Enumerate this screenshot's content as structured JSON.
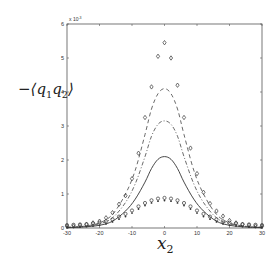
{
  "chart_data": {
    "type": "line",
    "title": "",
    "xlabel": "x_2",
    "ylabel": "-<q1 q2>",
    "ylabel_display": {
      "prefix": "−⟨",
      "q1": "q",
      "sub1": "1",
      "q2": "q",
      "sub2": "2",
      "suffix": "⟩"
    },
    "xlabel_display": {
      "var": "x",
      "sub": "2"
    },
    "y_multiplier": "x 10^-3",
    "y_multiplier_display": "x 10",
    "y_multiplier_exp": "-3",
    "xlim": [
      -30,
      30
    ],
    "ylim": [
      0,
      6
    ],
    "xticks": [
      -30,
      -20,
      -10,
      0,
      10,
      20,
      30
    ],
    "yticks": [
      0,
      1,
      2,
      3,
      4,
      5,
      6
    ],
    "grid": false,
    "legend": null,
    "series": [
      {
        "name": "dashed",
        "style": "dashed",
        "x": [
          -30,
          -25,
          -20,
          -16,
          -12,
          -9,
          -6,
          -4,
          -2,
          0,
          2,
          4,
          6,
          9,
          12,
          16,
          20,
          25,
          30
        ],
        "y": [
          0.02,
          0.05,
          0.15,
          0.4,
          1.0,
          1.7,
          2.75,
          3.5,
          3.95,
          4.1,
          3.95,
          3.5,
          2.75,
          1.7,
          1.0,
          0.4,
          0.15,
          0.05,
          0.02
        ]
      },
      {
        "name": "dash-dot",
        "style": "dashdot",
        "x": [
          -30,
          -25,
          -20,
          -16,
          -12,
          -9,
          -6,
          -4,
          -2,
          0,
          2,
          4,
          6,
          9,
          12,
          16,
          20,
          25,
          30
        ],
        "y": [
          0.02,
          0.04,
          0.12,
          0.3,
          0.75,
          1.3,
          2.1,
          2.7,
          3.05,
          3.15,
          3.05,
          2.7,
          2.1,
          1.3,
          0.75,
          0.3,
          0.12,
          0.04,
          0.02
        ]
      },
      {
        "name": "solid",
        "style": "solid",
        "x": [
          -30,
          -25,
          -20,
          -16,
          -12,
          -9,
          -6,
          -4,
          -2,
          0,
          2,
          4,
          6,
          9,
          12,
          16,
          20,
          25,
          30
        ],
        "y": [
          0.01,
          0.03,
          0.08,
          0.2,
          0.5,
          0.85,
          1.35,
          1.75,
          2.02,
          2.1,
          2.02,
          1.75,
          1.35,
          0.85,
          0.5,
          0.2,
          0.08,
          0.03,
          0.01
        ]
      },
      {
        "name": "diamonds",
        "style": "marker-diamond",
        "x": [
          -30,
          -28,
          -26,
          -24,
          -22,
          -20,
          -18,
          -16,
          -14,
          -12,
          -10,
          -8,
          -6,
          -4,
          -2,
          0,
          2,
          4,
          6,
          8,
          10,
          12,
          14,
          16,
          18,
          20,
          22,
          24,
          26,
          28,
          30
        ],
        "y": [
          0.05,
          0.06,
          0.08,
          0.1,
          0.15,
          0.2,
          0.3,
          0.45,
          0.7,
          0.95,
          1.45,
          2.2,
          3.25,
          4.15,
          5.05,
          5.45,
          5.0,
          4.2,
          3.25,
          2.35,
          1.6,
          1.05,
          0.72,
          0.5,
          0.35,
          0.22,
          0.15,
          0.1,
          0.08,
          0.06,
          0.05
        ]
      },
      {
        "name": "circles",
        "style": "marker-circle",
        "x": [
          -30,
          -28,
          -26,
          -24,
          -22,
          -20,
          -18,
          -16,
          -14,
          -12,
          -10,
          -8,
          -6,
          -4,
          -2,
          0,
          2,
          4,
          6,
          8,
          10,
          12,
          14,
          16,
          18,
          20,
          22,
          24,
          26,
          28,
          30
        ],
        "y": [
          0.05,
          0.06,
          0.07,
          0.08,
          0.1,
          0.12,
          0.16,
          0.22,
          0.3,
          0.38,
          0.48,
          0.6,
          0.7,
          0.78,
          0.83,
          0.85,
          0.83,
          0.78,
          0.7,
          0.6,
          0.48,
          0.38,
          0.3,
          0.22,
          0.16,
          0.12,
          0.1,
          0.08,
          0.07,
          0.06,
          0.05
        ]
      }
    ]
  }
}
